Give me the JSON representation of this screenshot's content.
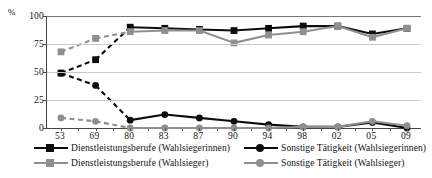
{
  "chart_data": {
    "type": "line",
    "title": "",
    "xlabel": "",
    "ylabel": "%",
    "ylim": [
      0,
      100
    ],
    "yticks": [
      0,
      25,
      50,
      75,
      100
    ],
    "grid": true,
    "legend_position": "bottom",
    "categories": [
      "53",
      "69",
      "80",
      "83",
      "87",
      "90",
      "94",
      "98",
      "02",
      "05",
      "09"
    ],
    "series": [
      {
        "name": "Dienstleistungsberufe (Wahlsiegerinnen)",
        "color": "#0d0d0d",
        "marker": "square",
        "linestyle": "dashed-then-solid",
        "values": [
          49,
          61,
          90,
          89,
          88,
          87,
          89,
          91,
          91,
          84,
          89
        ]
      },
      {
        "name": "Dienstleistungsberufe (Wahlsieger)",
        "color": "#8f8f8f",
        "marker": "square",
        "linestyle": "dashed-then-solid",
        "values": [
          68,
          80,
          86,
          87,
          87,
          76,
          83,
          86,
          91,
          81,
          89
        ]
      },
      {
        "name": "Sonstige Tätigkeit (Wahlsiegerinnen)",
        "color": "#0d0d0d",
        "marker": "circle",
        "linestyle": "dashed-then-solid",
        "values": [
          49,
          38,
          7,
          12,
          9,
          6,
          3,
          1,
          1,
          5,
          0
        ]
      },
      {
        "name": "Sonstige Tätigkeit  (Wahlsieger)",
        "color": "#8f8f8f",
        "marker": "circle",
        "linestyle": "dashed-then-solid",
        "values": [
          9,
          6,
          0,
          0,
          0,
          0,
          0,
          1,
          1,
          6,
          2
        ]
      }
    ]
  },
  "legend": {
    "items": [
      {
        "label": "Dienstleistungsberufe (Wahlsiegerinnen)",
        "color": "#0d0d0d",
        "marker": "square"
      },
      {
        "label": "Dienstleistungsberufe (Wahlsieger)",
        "color": "#8f8f8f",
        "marker": "square"
      },
      {
        "label": "Sonstige Tätigkeit (Wahlsiegerinnen)",
        "color": "#0d0d0d",
        "marker": "circle"
      },
      {
        "label": "Sonstige Tätigkeit  (Wahlsieger)",
        "color": "#8f8f8f",
        "marker": "circle"
      }
    ]
  },
  "axis": {
    "percent_symbol": "%",
    "y_labels": [
      "100",
      "75",
      "50",
      "25",
      "0"
    ],
    "x_labels": [
      "53",
      "69",
      "80",
      "83",
      "87",
      "90",
      "94",
      "98",
      "02",
      "05",
      "09"
    ]
  },
  "source_note": ""
}
